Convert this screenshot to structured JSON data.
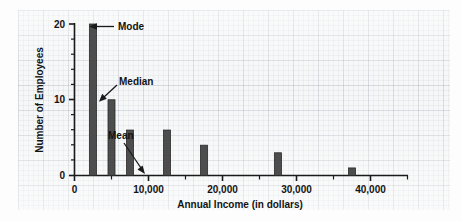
{
  "chart_data": {
    "type": "bar",
    "title": "",
    "xlabel": "Annual Income (in dollars)",
    "ylabel": "Number of Employees",
    "x": [
      2500,
      5000,
      7500,
      12500,
      17500,
      27500,
      37500
    ],
    "values": [
      20,
      10,
      6,
      6,
      4,
      3,
      1
    ],
    "categories": [
      "2,500",
      "5,000",
      "7,500",
      "12,500",
      "17,500",
      "27,500",
      "37,500"
    ],
    "xlim": [
      0,
      45000
    ],
    "ylim": [
      0,
      20
    ],
    "xticks": [
      0,
      10000,
      20000,
      30000,
      40000
    ],
    "xtick_labels": [
      "0",
      "10,000",
      "20,000",
      "30,000",
      "40,000"
    ],
    "xminor_ticks": [
      5000,
      15000,
      25000,
      35000
    ],
    "yticks": [
      0,
      10,
      20
    ],
    "ytick_labels": [
      "0",
      "10",
      "20"
    ],
    "yminor_ticks": [
      2,
      4,
      6,
      8,
      12,
      14,
      16,
      18
    ],
    "grid": true,
    "legend": "none",
    "bar_color": "#4d4d4d",
    "annotations": [
      {
        "label": "Mode",
        "points_to_x": 2500,
        "points_to_y": 20
      },
      {
        "label": "Median",
        "points_to_x": 5000,
        "points_to_y": 10
      },
      {
        "label": "Mean",
        "points_to_x": 9800,
        "points_to_y": 0
      }
    ]
  },
  "axes": {
    "y_title": "Number of Employees",
    "x_title": "Annual Income (in dollars)",
    "y_labels": {
      "top": "20",
      "mid": "10",
      "bottom": "0"
    },
    "x_labels": {
      "t0": "0",
      "t1": "10,000",
      "t2": "20,000",
      "t3": "30,000",
      "t4": "40,000"
    }
  },
  "annotations": {
    "mode": "Mode",
    "median": "Median",
    "mean": "Mean"
  },
  "colors": {
    "bar": "#4d4d4d",
    "axis": "#1a1a1a",
    "paper": "#f4f5f6",
    "grid": "#96a0aa"
  }
}
